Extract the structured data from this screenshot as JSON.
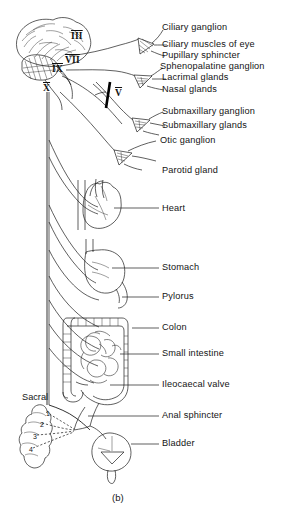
{
  "figure": {
    "caption": "(b)",
    "title_alt": "Parasympathetic nervous system outflow diagram"
  },
  "cranial_nerves": [
    {
      "numeral": "III",
      "x": 71,
      "y": 35
    },
    {
      "numeral": "VII",
      "x": 65,
      "y": 59
    },
    {
      "numeral": "IX",
      "x": 53,
      "y": 65
    },
    {
      "numeral": "X",
      "x": 44,
      "y": 85
    },
    {
      "numeral": "V",
      "x": 116,
      "y": 88
    }
  ],
  "labels": [
    {
      "text": "Ciliary ganglion",
      "x": 162,
      "y": 28
    },
    {
      "text": "Ciliary muscles of eye",
      "x": 162,
      "y": 45
    },
    {
      "text": "Pupillary sphincter",
      "x": 162,
      "y": 56
    },
    {
      "text": "Sphenopalatine ganglion",
      "x": 162,
      "y": 67
    },
    {
      "text": "Lacrimal glands",
      "x": 162,
      "y": 78
    },
    {
      "text": "Nasal glands",
      "x": 162,
      "y": 89
    },
    {
      "text": "Submaxillary ganglion",
      "x": 162,
      "y": 112
    },
    {
      "text": "Submaxillary glands",
      "x": 162,
      "y": 126
    },
    {
      "text": "Otic ganglion",
      "x": 162,
      "y": 140
    },
    {
      "text": "Parotid gland",
      "x": 162,
      "y": 162
    },
    {
      "text": "Heart",
      "x": 162,
      "y": 210
    },
    {
      "text": "Stomach",
      "x": 162,
      "y": 267
    },
    {
      "text": "Pylorus",
      "x": 162,
      "y": 295
    },
    {
      "text": "Colon",
      "x": 162,
      "y": 328
    },
    {
      "text": "Small intestine",
      "x": 162,
      "y": 353
    },
    {
      "text": "Ileocaecal valve",
      "x": 162,
      "y": 384
    },
    {
      "text": "Anal sphincter",
      "x": 162,
      "y": 415
    },
    {
      "text": "Bladder",
      "x": 162,
      "y": 443
    }
  ],
  "sacral": {
    "label": "Sacral",
    "label_x": 22,
    "label_y": 398,
    "segments": [
      {
        "n": "1",
        "x": 47,
        "y": 414
      },
      {
        "n": "2",
        "x": 41,
        "y": 425
      },
      {
        "n": "3",
        "x": 34,
        "y": 437
      },
      {
        "n": "4",
        "x": 30,
        "y": 450
      }
    ]
  },
  "organs": [
    {
      "name": "brain",
      "interactable": false
    },
    {
      "name": "heart",
      "interactable": false
    },
    {
      "name": "stomach",
      "interactable": false
    },
    {
      "name": "colon",
      "interactable": false
    },
    {
      "name": "small-intestine",
      "interactable": false
    },
    {
      "name": "rectum",
      "interactable": false
    },
    {
      "name": "bladder",
      "interactable": false
    },
    {
      "name": "sacral-vertebrae",
      "interactable": false
    }
  ],
  "colors": {
    "ink": "#1b1b1b",
    "background": "#ffffff"
  }
}
